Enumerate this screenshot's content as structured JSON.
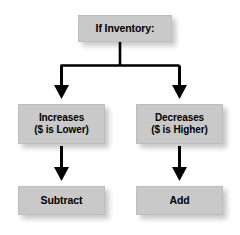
{
  "diagram": {
    "colors": {
      "node_fill": "#c9c9c9",
      "node_border": "#bdbdbd",
      "text": "#000000",
      "connector": "#000000",
      "background": "#ffffff"
    },
    "nodes": {
      "root": {
        "label": "If Inventory:"
      },
      "increases": {
        "line1": "Increases",
        "line2": "($ is Lower)"
      },
      "decreases": {
        "line1": "Decreases",
        "line2": "($ is Higher)"
      },
      "subtract": {
        "label": "Subtract"
      },
      "add": {
        "label": "Add"
      }
    },
    "edges": [
      {
        "name": "root-to-branch-split",
        "from": "root",
        "to": "split",
        "arrow": false
      },
      {
        "name": "branch-to-increases",
        "from": "split",
        "to": "increases",
        "arrow": true
      },
      {
        "name": "branch-to-decreases",
        "from": "split",
        "to": "decreases",
        "arrow": true
      },
      {
        "name": "increases-to-subtract",
        "from": "increases",
        "to": "subtract",
        "arrow": true
      },
      {
        "name": "decreases-to-add",
        "from": "decreases",
        "to": "add",
        "arrow": true
      }
    ]
  }
}
